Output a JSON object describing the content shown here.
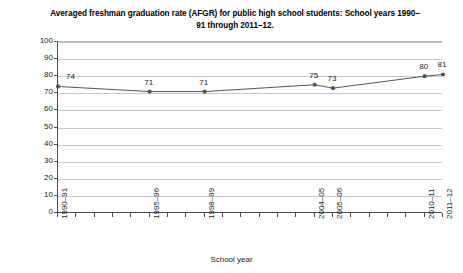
{
  "chart_data": {
    "type": "line",
    "title": "Averaged freshman graduation rate (AFGR) for public high school students: School years 1990–91 through 2011–12.",
    "xlabel": "School year",
    "ylabel": "Percent",
    "ylim": [
      0,
      100
    ],
    "ytick_step": 10,
    "yticks": [
      "0",
      "10",
      "20",
      "30",
      "40",
      "50",
      "60",
      "70",
      "80",
      "90",
      "100"
    ],
    "grid": true,
    "legend": "none",
    "x_tick_count": 22,
    "categories": [
      "1990–91",
      "1991–92",
      "1992–93",
      "1993–94",
      "1994–95",
      "1995–96",
      "1996–97",
      "1997–98",
      "1998–99",
      "1999–2000",
      "2000–01",
      "2001–02",
      "2002–03",
      "2003–04",
      "2004–05",
      "2005–06",
      "2006–07",
      "2007–08",
      "2008–09",
      "2009–10",
      "2010–11",
      "2011–12"
    ],
    "labeled_ticks": [
      "1990–91",
      "1995–96",
      "1998–99",
      "2004–05",
      "2005–06",
      "2010–11",
      "2011–12"
    ],
    "points": [
      {
        "category": "1990–91",
        "value": 74,
        "label": "74",
        "label_side": "right"
      },
      {
        "category": "1995–96",
        "value": 71,
        "label": "71",
        "label_side": "center"
      },
      {
        "category": "1998–99",
        "value": 71,
        "label": "71",
        "label_side": "center"
      },
      {
        "category": "2004–05",
        "value": 75,
        "label": "75",
        "label_side": "center"
      },
      {
        "category": "2005–06",
        "value": 73,
        "label": "73",
        "label_side": "center"
      },
      {
        "category": "2010–11",
        "value": 80,
        "label": "80",
        "label_side": "center"
      },
      {
        "category": "2011–12",
        "value": 81,
        "label": "81",
        "label_side": "center"
      }
    ],
    "series": [
      {
        "name": "AFGR",
        "x": [
          "1990–91",
          "1995–96",
          "1998–99",
          "2004–05",
          "2005–06",
          "2010–11",
          "2011–12"
        ],
        "values": [
          74,
          71,
          71,
          75,
          73,
          80,
          81
        ]
      }
    ],
    "colors": {
      "line": "#555555",
      "marker": "#555555",
      "grid": "#c8c8c8",
      "axis": "#4d4d4d",
      "text": "#1a1a1a",
      "background": "#ffffff"
    }
  }
}
